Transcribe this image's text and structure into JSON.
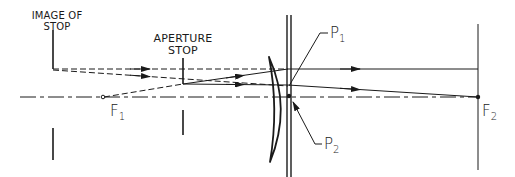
{
  "diagram": {
    "type": "optical-ray-diagram",
    "labels": {
      "image_of_stop_line1": "IMAGE OF",
      "image_of_stop_line2": "STOP",
      "aperture_stop_line1": "APERTURE",
      "aperture_stop_line2": "STOP",
      "f1_main": "F",
      "f1_sub": "1",
      "f2_main": "F",
      "f2_sub": "2",
      "p1_main": "P",
      "p1_sub": "1",
      "p2_main": "P",
      "p2_sub": "2"
    },
    "elements": [
      "optical-axis",
      "image-of-stop",
      "aperture-stop",
      "meniscus-lens",
      "principal-planes",
      "focal-point-F1",
      "focal-point-F2",
      "rays"
    ],
    "colors": {
      "ink": "#1a1a1a",
      "background": "#ffffff"
    }
  }
}
